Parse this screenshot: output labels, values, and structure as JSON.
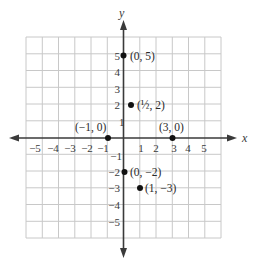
{
  "figure": {
    "axes": {
      "x_label": "x",
      "y_label": "y"
    },
    "grid": {
      "x_min": -6,
      "x_max": 6,
      "y_min": -6,
      "y_max": 6
    },
    "x_ticks": [
      {
        "v": -5,
        "label": "−5"
      },
      {
        "v": -4,
        "label": "−4"
      },
      {
        "v": -3,
        "label": "−3"
      },
      {
        "v": -2,
        "label": "−2"
      },
      {
        "v": -1,
        "label": "−1"
      },
      {
        "v": 1,
        "label": "1"
      },
      {
        "v": 2,
        "label": "2"
      },
      {
        "v": 3,
        "label": "3"
      },
      {
        "v": 4,
        "label": "4"
      },
      {
        "v": 5,
        "label": "5"
      }
    ],
    "y_ticks": [
      {
        "v": 5,
        "label": "5"
      },
      {
        "v": 4,
        "label": "4"
      },
      {
        "v": 3,
        "label": "3"
      },
      {
        "v": 2,
        "label": "2"
      },
      {
        "v": 1,
        "label": "1"
      },
      {
        "v": -1,
        "label": "−1"
      },
      {
        "v": -2,
        "label": "−2"
      },
      {
        "v": -3,
        "label": "−3"
      },
      {
        "v": -4,
        "label": "−4"
      },
      {
        "v": -5,
        "label": "−5"
      }
    ],
    "points": [
      {
        "x": 0,
        "y": 5,
        "label": "(0, 5)"
      },
      {
        "x": 0.5,
        "y": 2,
        "label": "(½, 2)"
      },
      {
        "x": -1,
        "y": 0,
        "label": "(−1, 0)"
      },
      {
        "x": 3,
        "y": 0,
        "label": "(3, 0)"
      },
      {
        "x": 0,
        "y": -2,
        "label": "(0, −2)"
      },
      {
        "x": 1,
        "y": -3,
        "label": "(1, −3)"
      }
    ],
    "colors": {
      "grid": "#c8c8c8",
      "axis": "#3a3a3a",
      "point": "#111111"
    }
  }
}
